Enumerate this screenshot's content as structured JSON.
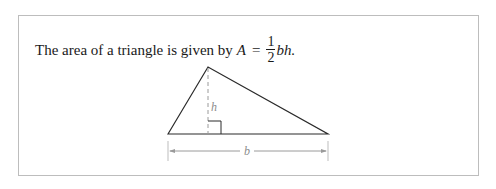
{
  "text": {
    "prefix": "The area of a triangle is given by",
    "area_var": "A",
    "equals": "=",
    "numerator": "1",
    "denominator": "2",
    "suffix": "bh."
  },
  "figure": {
    "height_label": "h",
    "base_label": "b"
  }
}
